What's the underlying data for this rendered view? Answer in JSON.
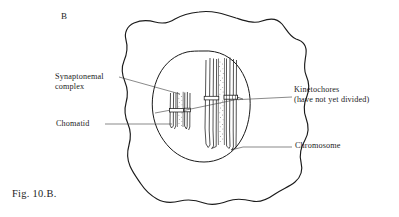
{
  "figure": {
    "panel_letter": "B",
    "caption": "Fig. 10.B.",
    "colors": {
      "background": "#ffffff",
      "ink": "#1a1a1a",
      "leader_line": "#3a3a3a",
      "stipple": "#4a4a4a"
    }
  },
  "labels": {
    "synaptonemal": {
      "line1": "Synaptonemal",
      "line2": "complex"
    },
    "chomatid": "Chomatid",
    "kinetochores": {
      "line1": "Kinetochores",
      "line2": "(have not yet divided)"
    },
    "chromosome": "Chromosome"
  },
  "structures": {
    "cell_membrane": "wavy irregular cell outline",
    "nucleus": "oval nuclear envelope",
    "bivalent_small": "small paired chromosome with synaptonemal complex",
    "bivalent_large": "large paired chromosome with synaptonemal complex",
    "kinetochore_count": 2
  }
}
